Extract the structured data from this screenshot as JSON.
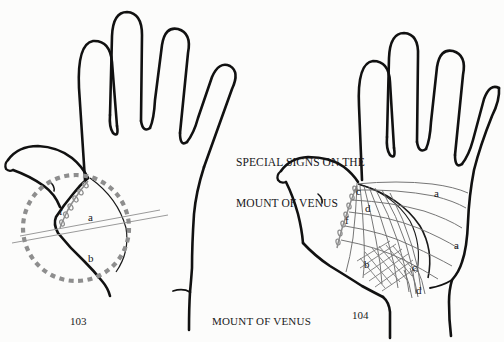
{
  "figure": {
    "title_line1": "SPECIAL SIGNS ON THE",
    "title_line2": "MOUNT OF VENUS",
    "center_caption": "MOUNT OF VENUS",
    "left_figure_number": "103",
    "right_figure_number": "104",
    "background_color": "#fcfcfb",
    "ink_color": "#111111",
    "marking_color": "#8a8a8a"
  },
  "left_hand": {
    "name": "fig-103-left-palm",
    "description": "Palm outline with dashed circle enclosing the Mount of Venus",
    "labels": [
      {
        "text": "f",
        "x": 59,
        "y": 206
      },
      {
        "text": "a",
        "x": 88,
        "y": 212
      },
      {
        "text": "b",
        "x": 88,
        "y": 253
      }
    ]
  },
  "right_hand": {
    "name": "fig-104-right-palm",
    "description": "Palm outline with grille and grid markings on the Mount of Venus",
    "labels": [
      {
        "text": "c",
        "x": 356,
        "y": 186
      },
      {
        "text": "a",
        "x": 434,
        "y": 188
      },
      {
        "text": "d",
        "x": 365,
        "y": 203
      },
      {
        "text": "f",
        "x": 345,
        "y": 215
      },
      {
        "text": "b",
        "x": 364,
        "y": 259
      },
      {
        "text": "c",
        "x": 412,
        "y": 262
      },
      {
        "text": "a",
        "x": 454,
        "y": 240
      },
      {
        "text": "d",
        "x": 416,
        "y": 285
      }
    ]
  }
}
